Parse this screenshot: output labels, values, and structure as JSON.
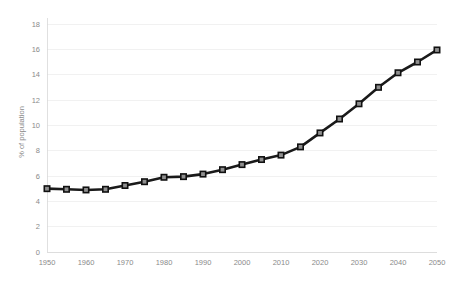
{
  "chart_data": {
    "type": "line",
    "title": "",
    "subtitle": "",
    "xlabel": "",
    "ylabel": "% of population",
    "x": [
      1950,
      1955,
      1960,
      1965,
      1970,
      1975,
      1980,
      1985,
      1990,
      1995,
      2000,
      2005,
      2010,
      2015,
      2020,
      2025,
      2030,
      2035,
      2040,
      2045,
      2050
    ],
    "values": [
      5.0,
      4.95,
      4.9,
      4.95,
      5.25,
      5.55,
      5.9,
      5.95,
      6.15,
      6.5,
      6.9,
      7.3,
      7.65,
      8.3,
      9.4,
      10.5,
      11.7,
      13.0,
      14.15,
      15.0,
      15.95
    ],
    "series": [
      {
        "name": "% of population",
        "values": [
          5.0,
          4.95,
          4.9,
          4.95,
          5.25,
          5.55,
          5.9,
          5.95,
          6.15,
          6.5,
          6.9,
          7.3,
          7.65,
          8.3,
          9.4,
          10.5,
          11.7,
          13.0,
          14.15,
          15.0,
          15.95
        ]
      }
    ],
    "xlim": [
      1950,
      2050
    ],
    "ylim": [
      0,
      18
    ],
    "x_ticks": [
      1950,
      1960,
      1970,
      1980,
      1990,
      2000,
      2010,
      2020,
      2030,
      2040,
      2050
    ],
    "x_tick_labels": [
      "1950",
      "1960",
      "1970",
      "1980",
      "1990",
      "2000",
      "2010",
      "2020",
      "2030",
      "2040",
      "2050"
    ],
    "y_ticks": [
      0,
      2,
      4,
      6,
      8,
      10,
      12,
      14,
      16,
      18
    ],
    "y_tick_labels": [
      "0",
      "2",
      "4",
      "6",
      "8",
      "10",
      "12",
      "14",
      "16",
      "18"
    ],
    "grid": true,
    "grid_axis": "y",
    "legend": false,
    "legend_position": "none",
    "marker": "square",
    "colors": {
      "line": "#1a1a1a",
      "marker_fill": "#8f8f8f",
      "marker_stroke": "#111111",
      "grid": "#ededed",
      "axis": "#d8d8d8",
      "tick_label": "#8a8a8a",
      "background": "#ffffff"
    }
  }
}
